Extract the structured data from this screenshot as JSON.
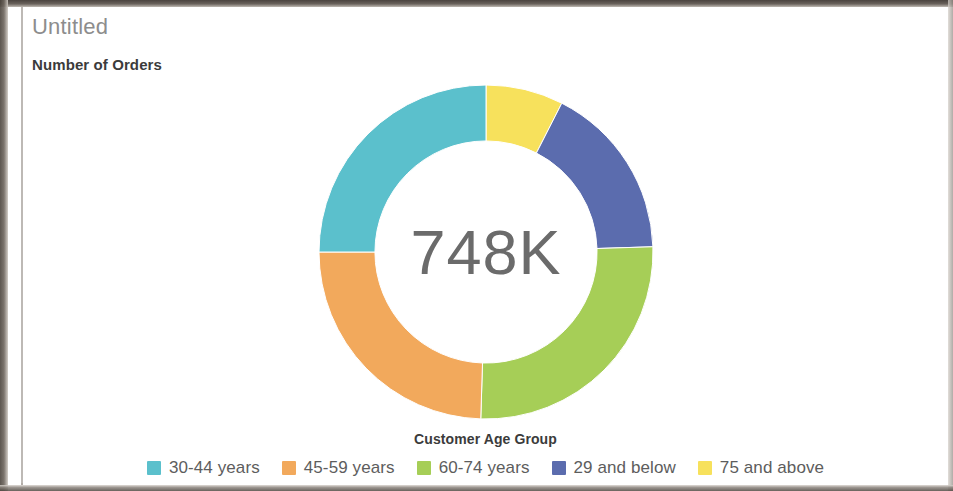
{
  "header": {
    "title": "Untitled",
    "subtitle": "Number of Orders"
  },
  "center": {
    "value": "748K"
  },
  "legend": {
    "title": "Customer Age Group",
    "items": [
      {
        "label": "30-44 years",
        "color": "#5BC0CC"
      },
      {
        "label": "45-59 years",
        "color": "#F2A95C"
      },
      {
        "label": "60-74 years",
        "color": "#A6CE57"
      },
      {
        "label": "29 and below",
        "color": "#5B6CAE"
      },
      {
        "label": "75 and above",
        "color": "#F7E15C"
      }
    ]
  },
  "chart_data": {
    "type": "pie",
    "variant": "donut",
    "title": "Untitled",
    "subtitle": "Number of Orders",
    "center_label": "748K",
    "total": 748000,
    "legend_title": "Customer Age Group",
    "legend_position": "bottom",
    "start_angle_deg": 0,
    "direction": "clockwise",
    "inner_radius_ratio": 0.665,
    "categories": [
      "75 and above",
      "29 and below",
      "60-74 years",
      "45-59 years",
      "30-44 years"
    ],
    "values": [
      7.5,
      17.0,
      26.0,
      24.5,
      25.0
    ],
    "unit": "percent",
    "slices": [
      {
        "label": "75 and above",
        "percent": 7.5,
        "color": "#F7E15C",
        "start_deg": 0,
        "end_deg": 27,
        "order": 1
      },
      {
        "label": "29 and below",
        "percent": 17.0,
        "color": "#5B6CAE",
        "start_deg": 27,
        "end_deg": 88.2,
        "order": 2
      },
      {
        "label": "60-74 years",
        "percent": 26.0,
        "color": "#A6CE57",
        "start_deg": 88.2,
        "end_deg": 181.8,
        "order": 3
      },
      {
        "label": "45-59 years",
        "percent": 24.5,
        "color": "#F2A95C",
        "start_deg": 181.8,
        "end_deg": 270,
        "order": 4
      },
      {
        "label": "30-44 years",
        "percent": 25.0,
        "color": "#5BC0CC",
        "start_deg": 270,
        "end_deg": 360,
        "order": 5
      }
    ],
    "xlabel": "",
    "ylabel": "",
    "grid": false
  }
}
